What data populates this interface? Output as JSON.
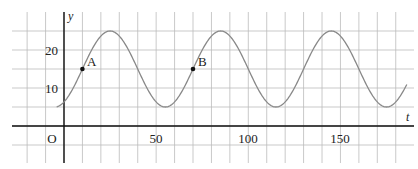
{
  "chart_data": {
    "type": "line",
    "title": "",
    "xlabel": "t",
    "ylabel": "y",
    "origin_label": "O",
    "grid": true,
    "x_ticks": [
      50,
      100,
      150
    ],
    "x_tick_labels": [
      "50",
      "100",
      "150"
    ],
    "y_ticks": [
      10,
      20
    ],
    "y_tick_labels": [
      "10",
      "20"
    ],
    "xlim": [
      -27,
      186
    ],
    "ylim": [
      -9,
      30
    ],
    "grid_x_step": 10,
    "grid_y_step": 5,
    "series": [
      {
        "name": "y = 15 - 10cos(2π(t+5)/60)",
        "color": "#888888",
        "t_start": -4,
        "t_end": 186,
        "x": [
          -4,
          -5,
          10,
          25,
          40,
          55,
          70,
          85,
          100,
          115,
          130,
          145,
          160,
          175,
          186
        ],
        "values": [
          5.1,
          5,
          15,
          25,
          15,
          5,
          15,
          25,
          15,
          5,
          15,
          25,
          15,
          5,
          11.5
        ],
        "amplitude": 10,
        "midline": 15,
        "period": 60,
        "max": 25,
        "min": 5
      }
    ],
    "points": [
      {
        "label": "A",
        "t": 10,
        "y": 15
      },
      {
        "label": "B",
        "t": 70,
        "y": 15
      }
    ]
  }
}
